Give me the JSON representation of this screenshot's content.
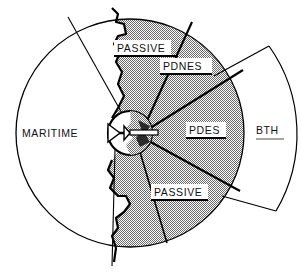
{
  "figure": {
    "type": "sector-coverage-diagram",
    "background_color": "#ffffff",
    "line_color": "#000000",
    "shaded_fill_color": "#a8a8a8",
    "unshaded_fill_color": "#ffffff"
  },
  "labels": {
    "maritime": "MARITIME",
    "passive_top": "PASSIVE",
    "passive_bottom": "PASSIVE",
    "pdnes": "PDNES",
    "pdes": "PDES",
    "bth": "BTH"
  },
  "regions": [
    {
      "id": "maritime",
      "label": "MARITIME",
      "shaded": false,
      "underlined": false,
      "description": "large unshaded left half of main coverage circle"
    },
    {
      "id": "passive-top",
      "label": "PASSIVE",
      "shaded": true,
      "underlined": true,
      "description": "upper shaded sector inside main circle, left of PDNES"
    },
    {
      "id": "pdnes",
      "label": "PDNES",
      "shaded": true,
      "underlined": true,
      "description": "upper-right shaded sector of main circle"
    },
    {
      "id": "pdes",
      "label": "PDES",
      "shaded": true,
      "underlined": true,
      "description": "central right shaded sector of main circle"
    },
    {
      "id": "passive-bottom",
      "label": "PASSIVE",
      "shaded": true,
      "underlined": true,
      "description": "lower shaded sector inside main circle, below PDES"
    },
    {
      "id": "bth",
      "label": "BTH",
      "shaded": false,
      "underlined": true,
      "description": "beyond-the-horizon band outside main circle on the right"
    }
  ],
  "center_platform": {
    "id": "platform-icon",
    "description": "small circular inset at diagram center containing an aircraft silhouette pointing left"
  },
  "coastline": {
    "id": "coastline",
    "description": "jagged vertical coastline running top to bottom just left of diagram center, separating land (shaded) from sea"
  }
}
